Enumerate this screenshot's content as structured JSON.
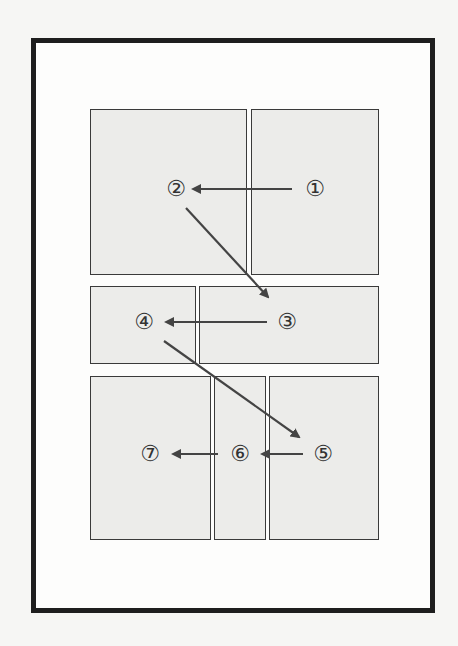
{
  "diagram": {
    "title": "",
    "colors": {
      "frame": "#1e1e1e",
      "panel_fill": "#ececea",
      "arrow": "#444444"
    },
    "panels": [
      {
        "id": 1,
        "row": 1,
        "position": "right"
      },
      {
        "id": 2,
        "row": 1,
        "position": "left"
      },
      {
        "id": 3,
        "row": 2,
        "position": "right"
      },
      {
        "id": 4,
        "row": 2,
        "position": "left"
      },
      {
        "id": 5,
        "row": 3,
        "position": "right"
      },
      {
        "id": 6,
        "row": 3,
        "position": "middle"
      },
      {
        "id": 7,
        "row": 3,
        "position": "left"
      }
    ],
    "labels": [
      "①",
      "②",
      "③",
      "④",
      "⑤",
      "⑥",
      "⑦"
    ],
    "arrows": [
      {
        "from": "①",
        "to": "②"
      },
      {
        "from": "②",
        "to": "③"
      },
      {
        "from": "③",
        "to": "④"
      },
      {
        "from": "④",
        "to": "⑤"
      },
      {
        "from": "⑤",
        "to": "⑥"
      },
      {
        "from": "⑥",
        "to": "⑦"
      }
    ]
  }
}
